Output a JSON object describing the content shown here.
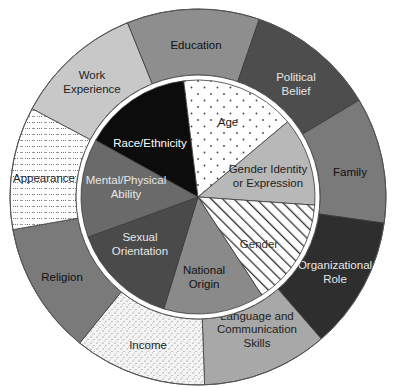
{
  "diagram": {
    "center": [
      198,
      197
    ],
    "outer_radius": 188,
    "ring_inner_radius": 122,
    "inner_radius": 117,
    "inner_segments": [
      {
        "id": "race-ethnicity",
        "lines": [
          "Race/Ethnicity"
        ],
        "start": -151,
        "end": -97,
        "fill": "#0c0c0c",
        "pattern": "",
        "text_color": "#ffffff",
        "label_pos": [
          150,
          143
        ]
      },
      {
        "id": "age",
        "lines": [
          "Age"
        ],
        "start": -97,
        "end": -40,
        "fill": "#ffffff",
        "pattern": "dots-sparse",
        "text_color": "#222222",
        "label_pos": [
          228,
          122
        ]
      },
      {
        "id": "gender-identity",
        "lines": [
          "Gender Identity",
          "or Expression"
        ],
        "start": -40,
        "end": 4,
        "fill": "#b8b8b8",
        "pattern": "",
        "text_color": "#222222",
        "label_pos": [
          268,
          176
        ]
      },
      {
        "id": "gender",
        "lines": [
          "Gender"
        ],
        "start": 4,
        "end": 57,
        "fill": "#ffffff",
        "pattern": "hatch",
        "text_color": "#333333",
        "label_pos": [
          259,
          244
        ]
      },
      {
        "id": "national-origin",
        "lines": [
          "National",
          "Origin"
        ],
        "start": 57,
        "end": 107,
        "fill": "#8a8a8a",
        "pattern": "",
        "text_color": "#111111",
        "label_pos": [
          204,
          277
        ]
      },
      {
        "id": "sexual-orientation",
        "lines": [
          "Sexual",
          "Orientation"
        ],
        "start": 107,
        "end": 160,
        "fill": "#4a4a4a",
        "pattern": "",
        "text_color": "#e6e6e6",
        "label_pos": [
          140,
          244
        ]
      },
      {
        "id": "mental-physical-ability",
        "lines": [
          "Mental/Physical",
          "Ability"
        ],
        "start": 160,
        "end": 209,
        "fill": "#6a6a6a",
        "pattern": "",
        "text_color": "#e6e6e6",
        "label_pos": [
          126,
          187
        ]
      }
    ],
    "outer_segments": [
      {
        "id": "work-experience",
        "lines": [
          "Work",
          "Experience"
        ],
        "start": -152,
        "end": -112,
        "fill": "#c8c8c8",
        "pattern": "",
        "text_color": "#222222",
        "label_pos": [
          92,
          82
        ]
      },
      {
        "id": "education",
        "lines": [
          "Education"
        ],
        "start": -112,
        "end": -71,
        "fill": "#8e8e8e",
        "pattern": "",
        "text_color": "#111111",
        "label_pos": [
          196,
          45
        ]
      },
      {
        "id": "political-belief",
        "lines": [
          "Political",
          "Belief"
        ],
        "start": -71,
        "end": -31,
        "fill": "#4d4d4d",
        "pattern": "",
        "text_color": "#e6e6e6",
        "label_pos": [
          296,
          84
        ]
      },
      {
        "id": "family",
        "lines": [
          "Family"
        ],
        "start": -31,
        "end": 8,
        "fill": "#7a7a7a",
        "pattern": "",
        "text_color": "#111111",
        "label_pos": [
          350,
          172
        ]
      },
      {
        "id": "organizational-role",
        "lines": [
          "Organizational",
          "Role"
        ],
        "start": 8,
        "end": 49,
        "fill": "#2e2e2e",
        "pattern": "",
        "text_color": "#e6e6e6",
        "label_pos": [
          335,
          272
        ]
      },
      {
        "id": "language-communication",
        "lines": [
          "Language and",
          "Communication",
          "Skills"
        ],
        "start": 49,
        "end": 88,
        "fill": "#a8a8a8",
        "pattern": "",
        "text_color": "#222222",
        "label_pos": [
          257,
          329
        ]
      },
      {
        "id": "income",
        "lines": [
          "Income"
        ],
        "start": 88,
        "end": 129,
        "fill": "#ffffff",
        "pattern": "dots-dense",
        "text_color": "#222222",
        "label_pos": [
          148,
          345
        ]
      },
      {
        "id": "religion",
        "lines": [
          "Religion"
        ],
        "start": 129,
        "end": 170,
        "fill": "#7a7a7a",
        "pattern": "",
        "text_color": "#111111",
        "label_pos": [
          62,
          277
        ]
      },
      {
        "id": "appearance",
        "lines": [
          "Appearance"
        ],
        "start": 170,
        "end": 208,
        "fill": "#ffffff",
        "pattern": "dashes",
        "text_color": "#222222",
        "label_pos": [
          44,
          178
        ]
      }
    ]
  }
}
